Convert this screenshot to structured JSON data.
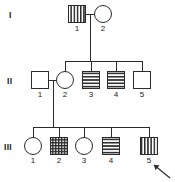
{
  "figure": {
    "type": "pedigree-chart",
    "width": 175,
    "height": 182,
    "background_color": "#ffffff",
    "line_color": "#2b2b2b",
    "text_color": "#1a1a1a"
  },
  "generations": [
    {
      "label": "I",
      "y": 14,
      "label_x": 9,
      "label_y": 11
    },
    {
      "label": "II",
      "y": 80,
      "label_x": 7,
      "label_y": 77
    },
    {
      "label": "III",
      "y": 146,
      "label_x": 4,
      "label_y": 143
    }
  ],
  "individuals": [
    {
      "id": "I-1",
      "generation": "I",
      "number": "1",
      "sex": "male",
      "shape": "square",
      "fill_pattern": "vertical-stripes",
      "x": 77,
      "y": 14,
      "size": 17,
      "proband": false
    },
    {
      "id": "I-2",
      "generation": "I",
      "number": "2",
      "sex": "female",
      "shape": "circle",
      "fill_pattern": "none",
      "x": 103,
      "y": 14,
      "size": 17,
      "proband": false
    },
    {
      "id": "II-1",
      "generation": "II",
      "number": "1",
      "sex": "male",
      "shape": "square",
      "fill_pattern": "none",
      "x": 40,
      "y": 80,
      "size": 17,
      "proband": false
    },
    {
      "id": "II-2",
      "generation": "II",
      "number": "2",
      "sex": "female",
      "shape": "circle",
      "fill_pattern": "none",
      "x": 65,
      "y": 80,
      "size": 17,
      "proband": false
    },
    {
      "id": "II-3",
      "generation": "II",
      "number": "3",
      "sex": "male",
      "shape": "square",
      "fill_pattern": "horizontal-stripes",
      "x": 91,
      "y": 80,
      "size": 17,
      "proband": false
    },
    {
      "id": "II-4",
      "generation": "II",
      "number": "4",
      "sex": "male",
      "shape": "square",
      "fill_pattern": "horizontal-stripes",
      "x": 116,
      "y": 80,
      "size": 17,
      "proband": false
    },
    {
      "id": "II-5",
      "generation": "II",
      "number": "5",
      "sex": "male",
      "shape": "square",
      "fill_pattern": "none",
      "x": 142,
      "y": 80,
      "size": 17,
      "proband": false
    },
    {
      "id": "III-1",
      "generation": "III",
      "number": "1",
      "sex": "female",
      "shape": "circle",
      "fill_pattern": "none",
      "x": 33,
      "y": 146,
      "size": 17,
      "proband": false
    },
    {
      "id": "III-2",
      "generation": "III",
      "number": "2",
      "sex": "male",
      "shape": "square",
      "fill_pattern": "cross-hatch",
      "x": 59,
      "y": 146,
      "size": 17,
      "proband": false
    },
    {
      "id": "III-3",
      "generation": "III",
      "number": "3",
      "sex": "female",
      "shape": "circle",
      "fill_pattern": "none",
      "x": 84,
      "y": 146,
      "size": 17,
      "proband": false
    },
    {
      "id": "III-4",
      "generation": "III",
      "number": "4",
      "sex": "male",
      "shape": "square",
      "fill_pattern": "horizontal-stripes",
      "x": 111,
      "y": 146,
      "size": 17,
      "proband": false
    },
    {
      "id": "III-5",
      "generation": "III",
      "number": "5",
      "sex": "male",
      "shape": "square",
      "fill_pattern": "vertical-stripes",
      "x": 149,
      "y": 146,
      "size": 17,
      "proband": true
    }
  ],
  "matings": [
    {
      "id": "mating-I",
      "partner_a": "I-1",
      "partner_b": "I-2",
      "line_y": 14,
      "x1": 86,
      "x2": 95,
      "drop_x": 90
    },
    {
      "id": "mating-II",
      "partner_a": "II-1",
      "partner_b": "II-2",
      "line_y": 80,
      "x1": 49,
      "x2": 57,
      "drop_x": 53
    }
  ],
  "sibships": [
    {
      "id": "sibship-II",
      "parents": "mating-I",
      "descent_from_y": 14,
      "sib_line_y": 61,
      "sib_line_x1": 65,
      "sib_line_x2": 142,
      "drop_x": 90,
      "children": [
        "II-2",
        "II-3",
        "II-4",
        "II-5"
      ]
    },
    {
      "id": "sibship-III",
      "parents": "mating-II",
      "descent_from_y": 80,
      "sib_line_y": 127,
      "sib_line_x1": 33,
      "sib_line_x2": 149,
      "drop_x": 53,
      "children": [
        "III-1",
        "III-2",
        "III-3",
        "III-4",
        "III-5"
      ]
    }
  ],
  "proband_arrow": {
    "id": "proband-arrow",
    "points_to": "III-5",
    "tail_x": 170,
    "tail_y": 178,
    "head_x": 154,
    "head_y": 165
  }
}
